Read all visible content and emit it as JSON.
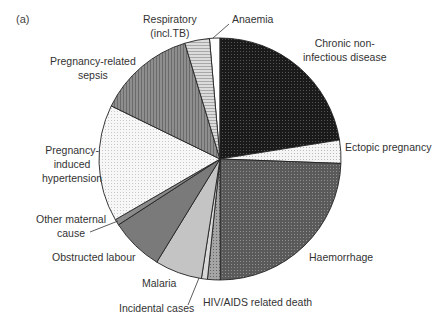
{
  "panel_label": "(a)",
  "chart_data": {
    "type": "pie",
    "title": "",
    "start_angle_deg": -5,
    "direction": "clockwise",
    "center": [
      220,
      159
    ],
    "radius": 121,
    "slices": [
      {
        "label": "Anaemia",
        "value": 1.4,
        "fill": "#ffffff",
        "pattern": "plain"
      },
      {
        "label": "Chronic non-infectious disease",
        "value": 22.5,
        "fill": "#111111",
        "pattern": "grid"
      },
      {
        "label": "Ectopic pregnancy",
        "value": 3.1,
        "fill": "#f2f2f2",
        "pattern": "fine-grid"
      },
      {
        "label": "Haemorrhage",
        "value": 24.4,
        "fill": "#555555",
        "pattern": "dots"
      },
      {
        "label": "HIV/AIDS related death",
        "value": 1.7,
        "fill": "#9a9a9a",
        "pattern": "dots"
      },
      {
        "label": "Incidental cases",
        "value": 0.8,
        "fill": "#d8d8d8",
        "pattern": "plain"
      },
      {
        "label": "Malaria",
        "value": 6.3,
        "fill": "#c4c4c4",
        "pattern": "plain"
      },
      {
        "label": "Obstructed labour",
        "value": 7.1,
        "fill": "#7a7a7a",
        "pattern": "plain"
      },
      {
        "label": "Other maternal cause",
        "value": 0.8,
        "fill": "#8a8a8a",
        "pattern": "plain"
      },
      {
        "label": "Pregnancy-induced hypertension",
        "value": 15.6,
        "fill": "#f4f4f4",
        "pattern": "fine-dots"
      },
      {
        "label": "Pregnancy-related sepsis",
        "value": 13.1,
        "fill": "#8c8c8c",
        "pattern": "vertical-lines"
      },
      {
        "label": "Respiratory (incl.TB)",
        "value": 3.3,
        "fill": "#d0d0d0",
        "pattern": "horizontal-lines"
      }
    ],
    "legend": "none (direct labels)"
  },
  "labels": {
    "respiratory": [
      "Respiratory",
      "(incl.TB)"
    ],
    "anaemia": "Anaemia",
    "chronic": [
      "Chronic non-",
      "infectious disease"
    ],
    "sepsis": [
      "Pregnancy-related",
      "sepsis"
    ],
    "ectopic": "Ectopic pregnancy",
    "hypertension": [
      "Pregnancy-",
      "induced",
      "hypertension"
    ],
    "other": [
      "Other maternal",
      "cause"
    ],
    "obstructed": "Obstructed labour",
    "haemorrhage": "Haemorrhage",
    "malaria": "Malaria",
    "incidental": "Incidental cases",
    "hiv": "HIV/AIDS related death"
  }
}
